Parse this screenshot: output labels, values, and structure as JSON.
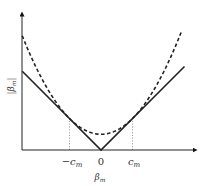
{
  "chart_data": {
    "type": "line",
    "title": "",
    "xlabel": "β_m",
    "ylabel": "|β_m|",
    "x_tick_labels": [
      "−c_m",
      "0",
      "c_m"
    ],
    "x_ticks": [
      -1,
      0,
      1
    ],
    "xlim": [
      -2.5,
      2.65
    ],
    "ylim": [
      0,
      4.3
    ],
    "grid": false,
    "series": [
      {
        "name": "absolute-value",
        "style": "solid",
        "formula": "|β|",
        "x": [
          -2.5,
          0,
          2.65
        ],
        "y": [
          2.5,
          0,
          2.65
        ]
      },
      {
        "name": "quadratic-upper-bound",
        "style": "dashed",
        "formula": "(β² + c²) / (2c)",
        "x": [
          -2.5,
          -2,
          -1.5,
          -1,
          -0.5,
          0,
          0.5,
          1,
          1.5,
          2,
          2.5
        ],
        "y": [
          3.625,
          2.5,
          1.625,
          1.0,
          0.625,
          0.5,
          0.625,
          1.0,
          1.625,
          2.5,
          3.625
        ]
      }
    ],
    "annotations": [
      {
        "type": "vertical-dotted-line",
        "x": -1,
        "label": "−c_m"
      },
      {
        "type": "vertical-dotted-line",
        "x": 1,
        "label": "c_m"
      }
    ]
  }
}
